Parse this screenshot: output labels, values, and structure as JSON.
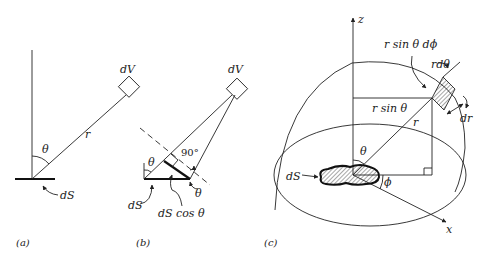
{
  "figure": {
    "panels": [
      {
        "id": "a",
        "caption": "(a)",
        "labels": {
          "volume": "dV",
          "distance": "r",
          "angle": "θ",
          "surface": "dS"
        }
      },
      {
        "id": "b",
        "caption": "(b)",
        "labels": {
          "volume": "dV",
          "right_angle": "90°",
          "angle_top": "θ",
          "angle_bottom": "θ",
          "surface": "dS",
          "projected": "dS cos θ"
        }
      },
      {
        "id": "c",
        "caption": "(c)",
        "labels": {
          "z_axis": "z",
          "x_axis": "x",
          "arc_phi": "r sin θ dϕ",
          "arc_theta": "rdθ",
          "radial": "dr",
          "radius_proj": "r sin θ",
          "radius": "r",
          "polar_angle": "θ",
          "azimuth": "ϕ",
          "surface": "dS"
        }
      }
    ],
    "colors": {
      "ink": "#222222",
      "background": "#ffffff"
    }
  }
}
